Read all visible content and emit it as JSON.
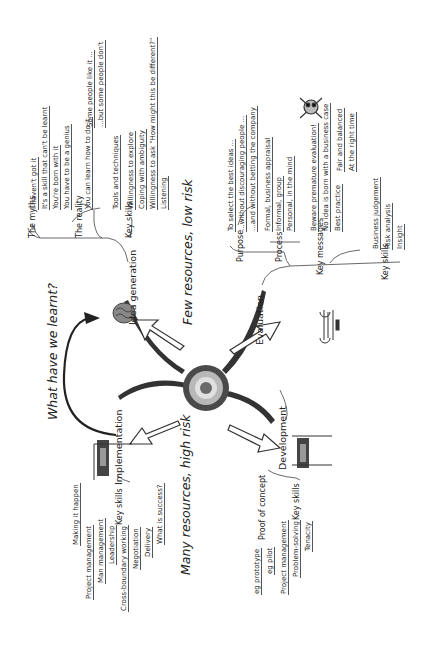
{
  "center": {
    "type": "target"
  },
  "banners": {
    "few": "Few resources, low risk",
    "many": "Many resources, high risk",
    "learnt": "What have we learnt?"
  },
  "branches": {
    "idea": {
      "label": "Idea generation",
      "myths_label": "The myths",
      "myths": [
        "I haven't got it",
        "It's a skill that can't be learnt",
        "You're born with it",
        "You have to be a genius"
      ],
      "reality_label": "The reality",
      "reality": [
        "You can learn how to do it",
        "Tools and techniques"
      ],
      "reality_sub": [
        "Some people like it ...",
        "...but some people don't"
      ],
      "skills_label": "Key skills",
      "skills": [
        "Willingness to explore",
        "Coping with ambiguity",
        "Willingness to ask \"How might this be different?\"",
        "Listening"
      ]
    },
    "evaluation": {
      "label": "Evaluation",
      "purpose_label": "Purpose",
      "purpose": [
        "To select the best ideas ...",
        "...without discouraging people ...",
        "...and without betting the company"
      ],
      "process_label": "Process",
      "process": [
        "Formal, business appraisal",
        "Informal, group",
        "Personal, in the mind"
      ],
      "messages_label": "Key messages",
      "messages": [
        "Beware premature evaluation!",
        "No idea is born with a business case",
        "Best practice"
      ],
      "best_practice": [
        "Fair and balanced",
        "At the right time"
      ],
      "skills_label": "Key skills",
      "skills": [
        "Business judgement",
        "Risk analysis",
        "Insight"
      ]
    },
    "development": {
      "label": "Development",
      "flag": "START",
      "poc_label": "Proof of concept",
      "poc": [
        "eg prototype",
        "eg pilot"
      ],
      "skills_label": "Key skills",
      "skills": [
        "Project management",
        "Problem-solving",
        "Tenacity"
      ]
    },
    "implementation": {
      "label": "Implementation",
      "flag": "FINISH",
      "making": "Making it happen",
      "skills_label": "Key skills",
      "skills": [
        "Project management",
        "Man management",
        "Leadership",
        "Cross-boundary working",
        "Negotiation",
        "Delivery"
      ],
      "success": "What is success?"
    }
  }
}
